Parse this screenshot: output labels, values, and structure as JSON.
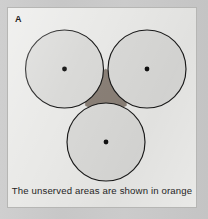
{
  "figure": {
    "panel_label": "A",
    "caption": "The unserved areas are shown in orange",
    "background_color": "#c9c9c9",
    "panel_background_color": "#e9e9e7",
    "panel_border_color": "#b6b6b4",
    "circle_fill_color": "#d9d9d7",
    "circle_stroke_color": "#1a1a1a",
    "center_dot_color": "#111111",
    "unserved_area_color": "#8a8077",
    "caption_text_color": "#1f1f1f"
  },
  "chart_data": {
    "type": "scatter",
    "title": "A",
    "subtitle": "The unserved areas are shown in orange",
    "xlabel": "",
    "ylabel": "",
    "grid": false,
    "legend_position": "none",
    "units": "panel pixels",
    "xlim": [
      0,
      190
    ],
    "ylim": [
      0,
      201
    ],
    "circle_radius": 39,
    "circles": [
      {
        "name": "top-left-coverage-circle",
        "cx": 56.5,
        "cy": 61,
        "r": 39
      },
      {
        "name": "top-right-coverage-circle",
        "cx": 139,
        "cy": 61,
        "r": 39
      },
      {
        "name": "bottom-coverage-circle",
        "cx": 98,
        "cy": 134,
        "r": 39
      }
    ],
    "center_points": [
      {
        "name": "top-left-center",
        "x": 56.5,
        "y": 61
      },
      {
        "name": "top-right-center",
        "x": 139,
        "y": 61
      },
      {
        "name": "bottom-center",
        "x": 98,
        "y": 134
      }
    ],
    "shaded_regions": [
      {
        "name": "unserved-interstitial-area",
        "label": "unserved area",
        "color": "#8a8077",
        "between": [
          "top-left-coverage-circle",
          "top-right-coverage-circle",
          "bottom-coverage-circle"
        ]
      }
    ]
  }
}
